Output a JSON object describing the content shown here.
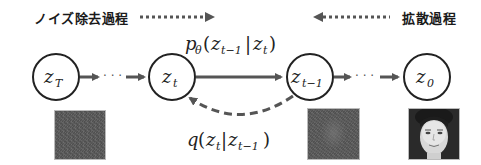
{
  "header": {
    "denoise_label": "ノイズ除去過程",
    "diffusion_label": "拡散過程"
  },
  "nodes": [
    {
      "id": "z_T",
      "label": "z",
      "sub": "T"
    },
    {
      "id": "z_t",
      "label": "z",
      "sub": "t"
    },
    {
      "id": "z_t-1",
      "label": "z",
      "sub": "t−1"
    },
    {
      "id": "z_0",
      "label": "z",
      "sub": "0"
    }
  ],
  "edges": {
    "forward_label": {
      "p": "p",
      "theta": "θ",
      "open": "(",
      "z1": "z",
      "z1sub": "t−1",
      "bar": "|",
      "z2": "z",
      "z2sub": "t",
      "close": ")"
    },
    "reverse_label": {
      "q": "q",
      "open": "(",
      "z1": "z",
      "z1sub": "t",
      "bar": "|",
      "z2": "z",
      "z2sub": "t−1",
      "close": ")"
    },
    "ellipsis": "· · ·"
  },
  "images": [
    {
      "name": "pure-noise",
      "under": "z_T"
    },
    {
      "name": "noisy-face",
      "under": "z_t-1"
    },
    {
      "name": "clean-face",
      "under": "z_0"
    }
  ],
  "colors": {
    "arrow": "#555555",
    "node_stroke": "#222222",
    "text": "#1a1a1a"
  }
}
